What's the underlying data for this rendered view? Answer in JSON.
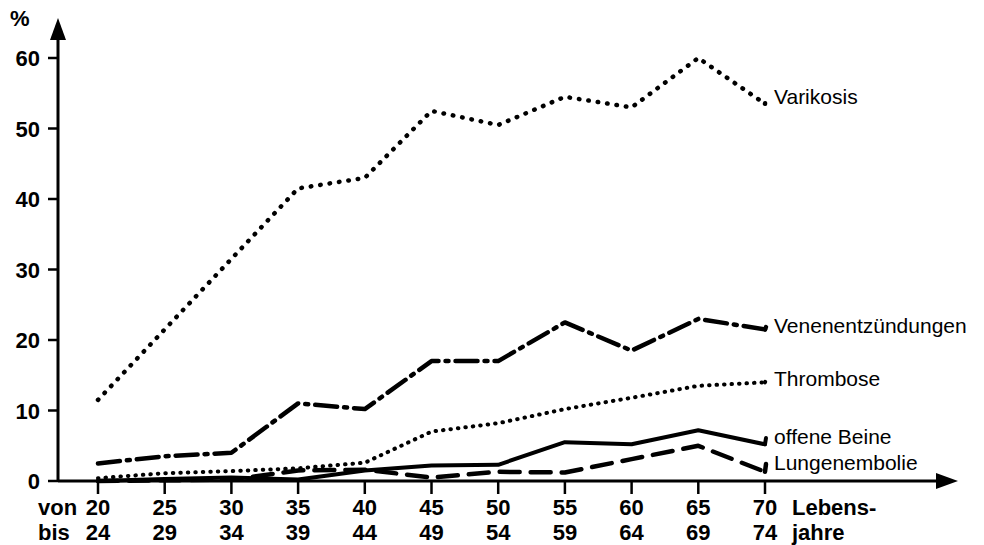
{
  "chart_data": {
    "type": "line",
    "title": "",
    "xlabel": "Lebens-jahre",
    "ylabel": "%",
    "ylim": [
      0,
      65
    ],
    "yticks": [
      0,
      10,
      20,
      30,
      40,
      50,
      60
    ],
    "grid": false,
    "legend_position": "right-inline",
    "x_axis_row_labels": [
      "von",
      "bis"
    ],
    "categories": [
      "20-24",
      "25-29",
      "30-34",
      "35-39",
      "40-44",
      "45-49",
      "50-54",
      "55-59",
      "60-64",
      "65-69",
      "70-74"
    ],
    "categories_from": [
      "20",
      "25",
      "30",
      "35",
      "40",
      "45",
      "50",
      "55",
      "60",
      "65",
      "70"
    ],
    "categories_to": [
      "24",
      "29",
      "34",
      "39",
      "44",
      "49",
      "54",
      "59",
      "64",
      "69",
      "74"
    ],
    "series": [
      {
        "name": "Varikosis",
        "style": "dotted-coarse",
        "values": [
          11.5,
          21.5,
          31.5,
          41.5,
          43,
          52.5,
          50.5,
          54.5,
          53,
          60,
          53.5
        ]
      },
      {
        "name": "Venenentzündungen",
        "style": "dash-dot",
        "values": [
          2.5,
          3.5,
          4,
          11,
          10.2,
          17,
          17,
          22.5,
          18.5,
          23,
          21.5
        ]
      },
      {
        "name": "Thrombose",
        "style": "dotted-fine",
        "values": [
          0.4,
          1.1,
          1.4,
          1.8,
          2.6,
          7,
          8.2,
          10.2,
          11.8,
          13.5,
          14
        ]
      },
      {
        "name": "offene Beine",
        "style": "solid",
        "values": [
          0,
          0.3,
          0.5,
          0.2,
          1.5,
          2.2,
          2.3,
          5.5,
          5.2,
          7.2,
          5.2
        ]
      },
      {
        "name": "Lungenembolie",
        "style": "dashed",
        "values": [
          0,
          0.1,
          0.2,
          1.5,
          1.6,
          0.5,
          1.3,
          1.2,
          3.1,
          5.0,
          1.3
        ]
      }
    ],
    "axis_arrows": true,
    "colors": {
      "axis": "#000000",
      "series": "#000000",
      "background": "#ffffff"
    }
  }
}
